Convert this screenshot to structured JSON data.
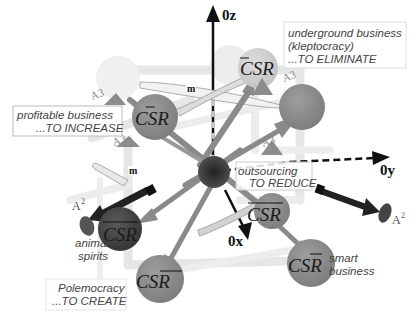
{
  "axes": {
    "z_label": "0z",
    "y_label": "0y",
    "x_label": "0x"
  },
  "boxes": {
    "underground": {
      "line1": "underground business",
      "line2": "(kleptocracy)",
      "line3": "...TO ELIMINATE"
    },
    "profitable": {
      "line1": "profitable business",
      "line2": "...TO INCREASE"
    },
    "outsourcing": {
      "line1": "outsourcing",
      "line2": "TO REDUCE"
    },
    "polemocracy": {
      "line1": "Polemocracy",
      "line2": "...TO CREATE"
    }
  },
  "nodes": {
    "top_right_label": "CSR",
    "left_label": "CSR",
    "center_right_label": "CSR",
    "animal_label": "CSR",
    "bottom_left_label": "CSR",
    "bottom_right_label": "CSR"
  },
  "captions": {
    "animal_spirits_1": "animal",
    "animal_spirits_2": "spirits",
    "smart_1": "smart",
    "smart_2": "business"
  },
  "markers": {
    "a3": "A3",
    "a2": "A",
    "a2_sup": "2",
    "m": "m"
  },
  "colors": {
    "node_gray": "#8e8e8e",
    "node_dark": "#4a4a4a",
    "node_light": "#c9c9c9",
    "arrow_gray": "#8a8a8a",
    "triangle": "#888888",
    "frame": "#e4e4e4"
  }
}
